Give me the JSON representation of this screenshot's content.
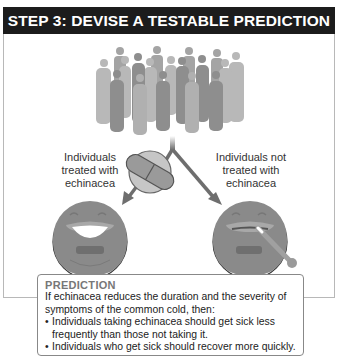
{
  "header": {
    "title": "STEP 3: DEVISE A TESTABLE PREDICTION"
  },
  "diagram": {
    "group_left_label": "Individuals treated with echinacea",
    "group_right_label": "Individuals not treated with echinacea",
    "icons": [
      "crowd-of-people",
      "capsule-pill",
      "smiling-mouth",
      "mouth-with-thermometer",
      "split-arrow"
    ],
    "colors": {
      "header_bg": "#1c1c1c",
      "figure_gray": "#9a9a9a",
      "arrow_gray": "#6e6e6e"
    }
  },
  "prediction": {
    "title": "PREDICTION",
    "intro": "If echinacea reduces the duration and the severity of symptoms of the common cold, then:",
    "bullets": [
      "Individuals taking echinacea should get sick less frequently than those not taking it.",
      "Individuals who get sick should recover more quickly."
    ]
  }
}
